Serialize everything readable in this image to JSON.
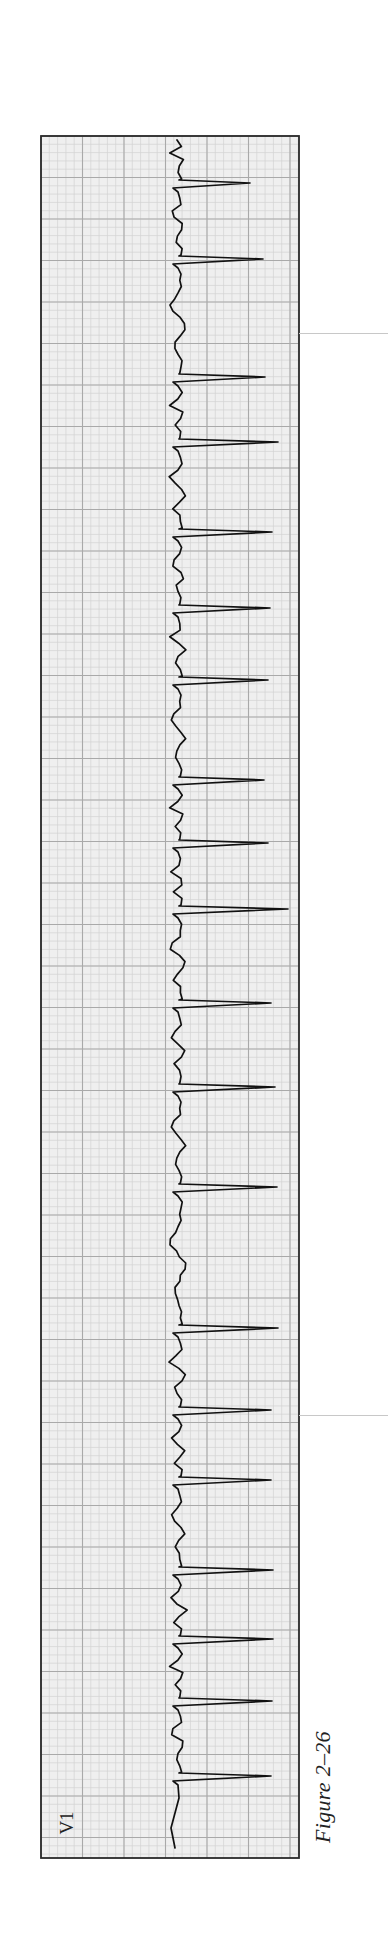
{
  "figure": {
    "caption": "Figure 2–26",
    "lead_label": "V1",
    "orientation": "rotated 90° (time runs top-to-bottom, voltage increases rightward)"
  },
  "colors": {
    "paper": "#efefef",
    "grid_minor": "#d2d2d2",
    "grid_major": "#a9a9a9",
    "border": "#2a2a2a",
    "trace": "#111111"
  },
  "chart_data": {
    "type": "line",
    "title": "Figure 2–26",
    "subtitle": "ECG rhythm strip, lead V1",
    "xlabel": "",
    "ylabel": "",
    "grid": true,
    "legend": [],
    "annotations": [
      "V1"
    ],
    "strip": {
      "box": {
        "x": 41,
        "y": 136,
        "width": 258,
        "height": 1722
      },
      "major_square_px": 41.5,
      "minor_squares_per_major": 5,
      "baseline_x": 181
    },
    "qrs_count": 18,
    "r_wave_tips": [
      {
        "y": 183,
        "x": 250
      },
      {
        "y": 259,
        "x": 263
      },
      {
        "y": 377,
        "x": 265
      },
      {
        "y": 442,
        "x": 278
      },
      {
        "y": 532,
        "x": 272
      },
      {
        "y": 608,
        "x": 270
      },
      {
        "y": 680,
        "x": 268
      },
      {
        "y": 780,
        "x": 264
      },
      {
        "y": 843,
        "x": 268
      },
      {
        "y": 909,
        "x": 288
      },
      {
        "y": 1003,
        "x": 271
      },
      {
        "y": 1087,
        "x": 275
      },
      {
        "y": 1187,
        "x": 277
      },
      {
        "y": 1328,
        "x": 278
      },
      {
        "y": 1410,
        "x": 271
      },
      {
        "y": 1480,
        "x": 271
      },
      {
        "y": 1570,
        "x": 273
      },
      {
        "y": 1639,
        "x": 273
      },
      {
        "y": 1701,
        "x": 272
      },
      {
        "y": 1776,
        "x": 271
      }
    ]
  }
}
